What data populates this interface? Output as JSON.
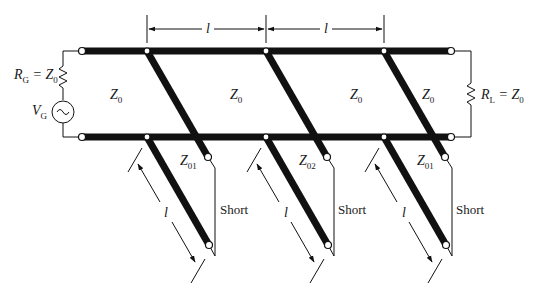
{
  "diagram": {
    "type": "transmission-line-filter-schematic",
    "source": {
      "resistor_label": "R",
      "resistor_sub": "G",
      "resistor_eq": " = Z",
      "resistor_eq_sub": "0",
      "generator_label": "V",
      "generator_sub": "G",
      "generator_symbol": "~"
    },
    "load": {
      "resistor_label": "R",
      "resistor_sub": "L",
      "resistor_eq": " = Z",
      "resistor_eq_sub": "0"
    },
    "main_line_sections": [
      {
        "label": "Z",
        "sub": "0"
      },
      {
        "label": "Z",
        "sub": "0"
      },
      {
        "label": "Z",
        "sub": "0"
      },
      {
        "label": "Z",
        "sub": "0"
      }
    ],
    "spacing_dimensions": [
      {
        "label": "l"
      },
      {
        "label": "l"
      }
    ],
    "stubs": [
      {
        "impedance": "Z",
        "impedance_sub": "01",
        "length": "l",
        "termination": "Short"
      },
      {
        "impedance": "Z",
        "impedance_sub": "02",
        "length": "l",
        "termination": "Short"
      },
      {
        "impedance": "Z",
        "impedance_sub": "01",
        "length": "l",
        "termination": "Short"
      }
    ],
    "colors": {
      "line": "#111111",
      "background": "#ffffff"
    }
  }
}
